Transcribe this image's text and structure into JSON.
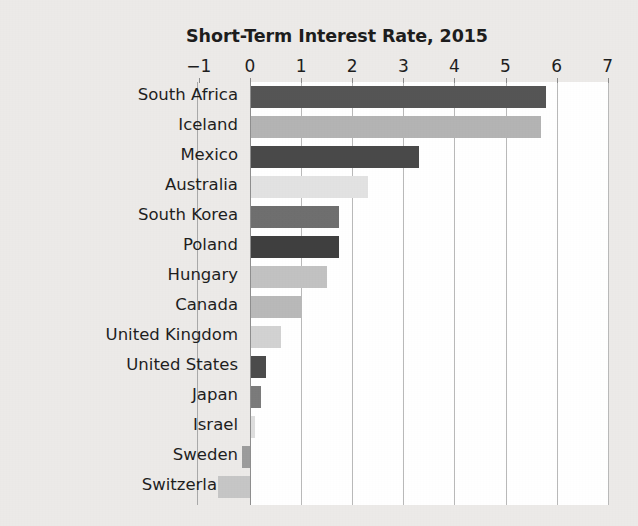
{
  "chart_data": {
    "type": "bar",
    "orientation": "horizontal",
    "title": "Short-Term Interest Rate, 2015",
    "xlabel": "",
    "ylabel": "",
    "xlim": [
      -1,
      7
    ],
    "xticks": [
      -1,
      0,
      1,
      2,
      3,
      4,
      5,
      6,
      7
    ],
    "xtick_labels": [
      "−1",
      "0",
      "1",
      "2",
      "3",
      "4",
      "5",
      "6",
      "7"
    ],
    "grid": true,
    "legend": "none",
    "categories": [
      "South Africa",
      "Iceland",
      "Mexico",
      "Australia",
      "South Korea",
      "Poland",
      "Hungary",
      "Canada",
      "United Kingdom",
      "United States",
      "Japan",
      "Israel",
      "Sweden",
      "Switzerland"
    ],
    "values": [
      5.8,
      5.7,
      3.3,
      2.3,
      1.75,
      1.75,
      1.5,
      1.0,
      0.6,
      0.32,
      0.21,
      0.1,
      -0.15,
      -0.62
    ],
    "bar_colors": [
      "#555555",
      "#b4b4b4",
      "#494949",
      "#e2e2e2",
      "#6f6f6f",
      "#3f3f3f",
      "#c2c2c2",
      "#b9b9b9",
      "#d2d2d2",
      "#4b4b4b",
      "#7b7b7b",
      "#dedede",
      "#9c9c9c",
      "#c6c6c6"
    ]
  },
  "colors": {
    "page_background": "#eceae8",
    "plot_background": "#ffffff",
    "gridline": "#b9b9b9",
    "axis_line": "#8e8e8e",
    "text": "#1e1e1e"
  }
}
